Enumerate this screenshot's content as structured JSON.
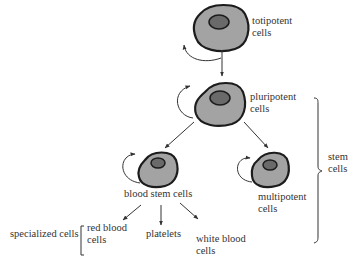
{
  "colors": {
    "cell_fill": "#a3a3a3",
    "cell_stroke": "#1c1c1c",
    "nucleus_fill": "#6a6a6a",
    "line": "#333333",
    "text": "#333333"
  },
  "labels": {
    "totipotent": [
      "totipotent",
      "cells"
    ],
    "pluripotent": [
      "pluripotent",
      "cells"
    ],
    "multipotent": [
      "multipotent",
      "cells"
    ],
    "blood_stem": "blood stem cells",
    "stem": [
      "stem",
      "cells"
    ],
    "specialized": "specialized cells",
    "red_blood": [
      "red blood",
      "cells"
    ],
    "platelets": "platelets",
    "white_blood": [
      "white blood",
      "cells"
    ]
  }
}
